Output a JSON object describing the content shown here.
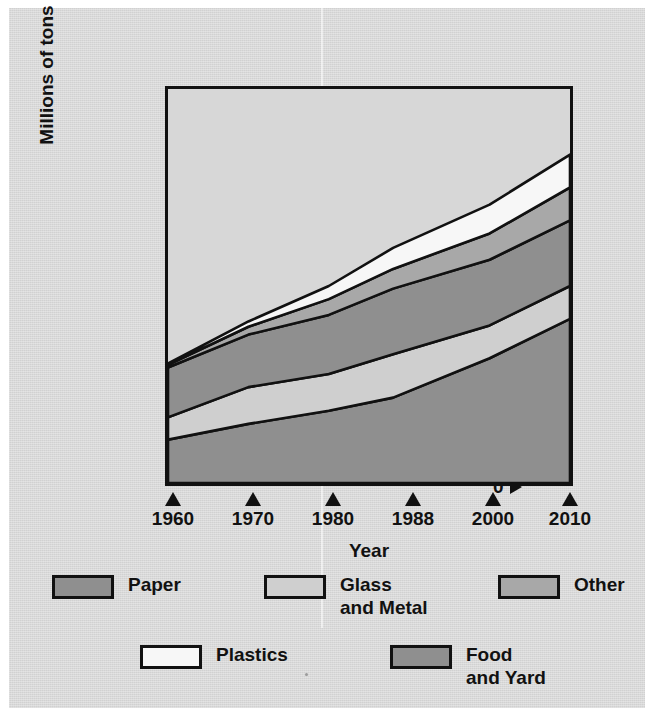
{
  "figure": {
    "background_color": "#dcdcdc",
    "plot_background_color": "#d7d7d7",
    "line_color": "#111111"
  },
  "axes": {
    "y_title": "Millions of tons",
    "x_title": "Year",
    "y_ticks": [
      "0",
      "50",
      "100",
      "150",
      "200",
      "250",
      "300"
    ],
    "x_ticks": [
      "1960",
      "1970",
      "1980",
      "1988",
      "2000",
      "2010"
    ]
  },
  "legend": {
    "items": [
      {
        "label": "Paper",
        "color": "#8f8f8f"
      },
      {
        "label": "Glass\nand Metal",
        "color": "#cfcfcf"
      },
      {
        "label": "Other",
        "color": "#a8a8a8"
      },
      {
        "label": "Plastics",
        "color": "#f7f7f7"
      },
      {
        "label": "Food\nand Yard",
        "color": "#8f8f8f"
      }
    ]
  },
  "chart_data": {
    "type": "area",
    "title": "",
    "xlabel": "Year",
    "ylabel": "Millions of tons",
    "xlim": [
      1960,
      2010
    ],
    "ylim": [
      0,
      300
    ],
    "grid": false,
    "legend_position": "bottom",
    "stacked": true,
    "x": [
      1960,
      1970,
      1980,
      1988,
      2000,
      2010
    ],
    "series": [
      {
        "name": "Paper",
        "color": "#8f8f8f",
        "values": [
          33,
          45,
          55,
          65,
          95,
          125
        ]
      },
      {
        "name": "Glass and Metal",
        "color": "#cfcfcf",
        "values": [
          17,
          28,
          28,
          33,
          25,
          25
        ]
      },
      {
        "name": "Food and Yard",
        "color": "#8f8f8f",
        "values": [
          38,
          40,
          45,
          50,
          50,
          50
        ]
      },
      {
        "name": "Other",
        "color": "#a8a8a8",
        "values": [
          2,
          6,
          12,
          15,
          20,
          25
        ]
      },
      {
        "name": "Plastics",
        "color": "#f7f7f7",
        "values": [
          1,
          4,
          10,
          16,
          22,
          25
        ]
      }
    ],
    "cumulative_tops": {
      "Paper": [
        33,
        45,
        55,
        65,
        95,
        125
      ],
      "Glass and Metal": [
        50,
        73,
        83,
        98,
        120,
        150
      ],
      "Food and Yard": [
        88,
        113,
        128,
        148,
        170,
        200
      ],
      "Other": [
        90,
        119,
        140,
        163,
        190,
        225
      ],
      "Plastics": [
        91,
        123,
        150,
        179,
        212,
        250
      ]
    }
  }
}
